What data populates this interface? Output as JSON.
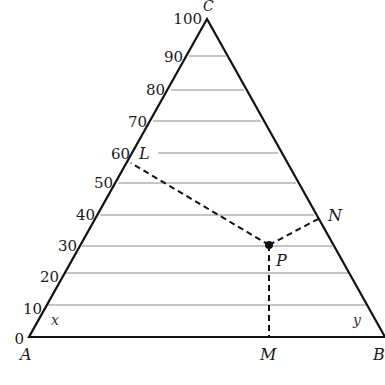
{
  "diagram": {
    "type": "ternary-phase-diagram",
    "vertices": {
      "A": {
        "label": "A",
        "x": 29,
        "y": 337
      },
      "B": {
        "label": "B",
        "x": 385,
        "y": 337
      },
      "C": {
        "label": "C",
        "x": 207,
        "y": 19
      }
    },
    "axis_ticks": [
      "0",
      "10",
      "20",
      "30",
      "40",
      "50",
      "60",
      "70",
      "80",
      "90",
      "100"
    ],
    "side_labels": {
      "left": "x",
      "right": "y"
    },
    "points": {
      "P": {
        "label": "P"
      },
      "L": {
        "label": "L"
      },
      "M": {
        "label": "M"
      },
      "N": {
        "label": "N"
      }
    },
    "colors": {
      "outline": "#111111",
      "gridline": "#888888",
      "dashed": "#111111"
    }
  }
}
